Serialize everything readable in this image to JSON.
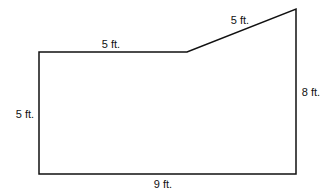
{
  "diagram": {
    "type": "polygon-floor-plan",
    "stroke_color": "#111111",
    "vertices": [
      [
        39,
        52
      ],
      [
        187,
        52
      ],
      [
        296,
        9
      ],
      [
        296,
        174
      ],
      [
        39,
        174
      ]
    ],
    "labels": {
      "top": "5 ft.",
      "slant": "5 ft.",
      "right": "8 ft.",
      "left": "5 ft.",
      "bottom": "9 ft."
    }
  }
}
